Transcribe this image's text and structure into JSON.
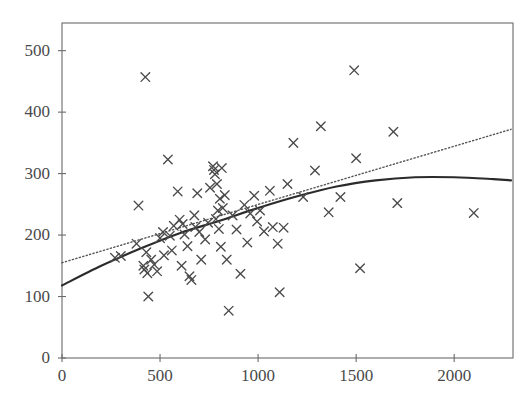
{
  "chart": {
    "title": "",
    "type": "scatter",
    "background": "#ffffff",
    "frame_color": "#6b6b6b",
    "marker_color": "#4a4a4a",
    "fit_line_color": "#2b2b2b",
    "trend_line_color": "#55555a"
  },
  "axes": {
    "x": {
      "label": "",
      "min": 0,
      "max": 2300,
      "ticks": [
        0,
        500,
        1000,
        1500,
        2000
      ],
      "tick_labels": [
        "0",
        "500",
        "1000",
        "1500",
        "2000"
      ]
    },
    "y": {
      "label": "",
      "min": 0,
      "max": 545,
      "ticks": [
        0,
        100,
        200,
        300,
        400,
        500
      ],
      "tick_labels": [
        "0",
        "100",
        "200",
        "300",
        "400",
        "500"
      ]
    }
  },
  "chart_data": {
    "type": "scatter",
    "title": "",
    "xlabel": "",
    "ylabel": "",
    "xlim": [
      0,
      2300
    ],
    "ylim": [
      0,
      545
    ],
    "xticks": [
      0,
      500,
      1000,
      1500,
      2000
    ],
    "yticks": [
      0,
      100,
      200,
      300,
      400,
      500
    ],
    "grid": false,
    "legend": "none",
    "marker": "x",
    "points": [
      [
        270,
        163
      ],
      [
        300,
        166
      ],
      [
        380,
        186
      ],
      [
        390,
        248
      ],
      [
        415,
        150
      ],
      [
        420,
        144
      ],
      [
        425,
        457
      ],
      [
        430,
        172
      ],
      [
        435,
        138
      ],
      [
        440,
        100
      ],
      [
        455,
        160
      ],
      [
        470,
        152
      ],
      [
        485,
        141
      ],
      [
        500,
        195
      ],
      [
        515,
        205
      ],
      [
        520,
        167
      ],
      [
        540,
        323
      ],
      [
        550,
        199
      ],
      [
        560,
        175
      ],
      [
        570,
        215
      ],
      [
        590,
        271
      ],
      [
        600,
        225
      ],
      [
        610,
        150
      ],
      [
        615,
        218
      ],
      [
        625,
        201
      ],
      [
        640,
        182
      ],
      [
        650,
        133
      ],
      [
        660,
        127
      ],
      [
        675,
        232
      ],
      [
        680,
        213
      ],
      [
        690,
        268
      ],
      [
        700,
        205
      ],
      [
        710,
        160
      ],
      [
        730,
        193
      ],
      [
        745,
        220
      ],
      [
        755,
        277
      ],
      [
        770,
        312
      ],
      [
        775,
        306
      ],
      [
        780,
        299
      ],
      [
        785,
        226
      ],
      [
        790,
        283
      ],
      [
        795,
        240
      ],
      [
        800,
        210
      ],
      [
        805,
        259
      ],
      [
        810,
        181
      ],
      [
        815,
        309
      ],
      [
        820,
        244
      ],
      [
        830,
        265
      ],
      [
        840,
        160
      ],
      [
        850,
        77
      ],
      [
        870,
        232
      ],
      [
        890,
        209
      ],
      [
        910,
        137
      ],
      [
        930,
        249
      ],
      [
        945,
        188
      ],
      [
        960,
        235
      ],
      [
        980,
        264
      ],
      [
        995,
        222
      ],
      [
        1010,
        240
      ],
      [
        1030,
        206
      ],
      [
        1060,
        272
      ],
      [
        1075,
        213
      ],
      [
        1100,
        186
      ],
      [
        1110,
        107
      ],
      [
        1130,
        212
      ],
      [
        1150,
        283
      ],
      [
        1180,
        350
      ],
      [
        1230,
        262
      ],
      [
        1290,
        305
      ],
      [
        1320,
        377
      ],
      [
        1360,
        237
      ],
      [
        1420,
        262
      ],
      [
        1490,
        468
      ],
      [
        1500,
        325
      ],
      [
        1520,
        146
      ],
      [
        1690,
        368
      ],
      [
        1710,
        252
      ],
      [
        2100,
        236
      ]
    ],
    "fit_curve": {
      "name": "smooth fit",
      "style": "solid",
      "x": [
        0,
        200,
        400,
        600,
        800,
        1000,
        1200,
        1400,
        1600,
        1800,
        2000,
        2200,
        2290
      ],
      "y": [
        118,
        150,
        178,
        203,
        223,
        244,
        263,
        279,
        289,
        294,
        294,
        291,
        289
      ]
    },
    "trend_line": {
      "name": "linear trend",
      "style": "dotted",
      "x": [
        0,
        2290
      ],
      "y": [
        155,
        372
      ]
    }
  }
}
